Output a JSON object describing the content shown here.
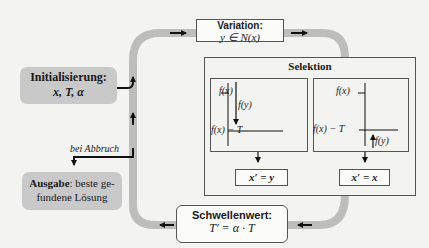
{
  "init": {
    "title": "Initialisierung:",
    "vars": "x, T, α"
  },
  "variation": {
    "title": "Variation:",
    "formula": "y ∈ N(x)"
  },
  "selection": {
    "title": "Selektion",
    "left_panel": {
      "upper_label": "f(x)",
      "lower_label": "f(x) − T",
      "arrow_label": "f(y)",
      "result": "x′ = y"
    },
    "right_panel": {
      "upper_label": "f(x)",
      "lower_label": "f(x) − T",
      "arrow_label": "f(y)",
      "result": "x′ = x"
    }
  },
  "threshold": {
    "title": "Schwellenwert:",
    "formula": "T′ = α · T"
  },
  "abort": {
    "label": "bei Abbruch"
  },
  "output": {
    "title": "Ausgabe",
    "text": ": beste ge-",
    "text2": "fundene Lösung"
  },
  "colors": {
    "path": "#bdbdbd",
    "gray_box": "#c9c9c9",
    "border": "#555555",
    "arrow": "#111111"
  }
}
